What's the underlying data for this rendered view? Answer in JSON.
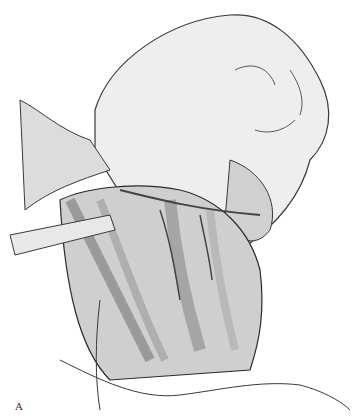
{
  "figure": {
    "label": "A",
    "palette": {
      "background": "#ffffff",
      "ink": "#2a2a2a",
      "midtone": "#8c8c8c",
      "light": "#d9d9d9"
    }
  }
}
